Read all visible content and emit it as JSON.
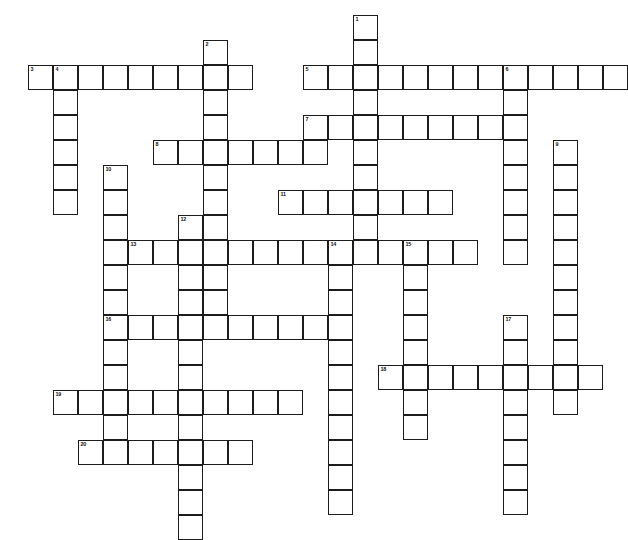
{
  "puzzle": {
    "title": "Crossword Puzzle Grid",
    "type": "blank-crossword-grid",
    "cell_size_px": 25,
    "grid_origin": {
      "x": 28,
      "y": 15
    },
    "border_color": "#1c1c1c",
    "cell_fill": "#ffffff",
    "page_background": "#ffffff",
    "numbered_clue_count": 20,
    "entries": [
      {
        "number": "1",
        "direction": "down",
        "col": 13,
        "row": 0,
        "length": 9,
        "label": "1"
      },
      {
        "number": "2",
        "direction": "down",
        "col": 7,
        "row": 1,
        "length": 12,
        "label": "2"
      },
      {
        "number": "3",
        "direction": "across",
        "col": 0,
        "row": 2,
        "length": 9,
        "label": "3"
      },
      {
        "number": "4",
        "direction": "down",
        "col": 1,
        "row": 2,
        "length": 6,
        "label": "4"
      },
      {
        "number": "5",
        "direction": "across",
        "col": 11,
        "row": 2,
        "length": 13,
        "label": "5"
      },
      {
        "number": "6",
        "direction": "down",
        "col": 19,
        "row": 2,
        "length": 8,
        "label": "6"
      },
      {
        "number": "7",
        "direction": "across",
        "col": 11,
        "row": 4,
        "length": 9,
        "label": "7"
      },
      {
        "number": "8",
        "direction": "across",
        "col": 5,
        "row": 5,
        "length": 7,
        "label": "8"
      },
      {
        "number": "9",
        "direction": "down",
        "col": 21,
        "row": 5,
        "length": 11,
        "label": "9"
      },
      {
        "number": "10",
        "direction": "down",
        "col": 3,
        "row": 6,
        "length": 12,
        "label": "10"
      },
      {
        "number": "11",
        "direction": "across",
        "col": 10,
        "row": 7,
        "length": 7,
        "label": "11"
      },
      {
        "number": "12",
        "direction": "down",
        "col": 6,
        "row": 8,
        "length": 13,
        "label": "12"
      },
      {
        "number": "13",
        "direction": "across",
        "col": 4,
        "row": 9,
        "length": 14,
        "label": "13"
      },
      {
        "number": "14",
        "direction": "down",
        "col": 12,
        "row": 9,
        "length": 11,
        "label": "14"
      },
      {
        "number": "15",
        "direction": "down",
        "col": 15,
        "row": 9,
        "length": 8,
        "label": "15"
      },
      {
        "number": "16",
        "direction": "across",
        "col": 3,
        "row": 12,
        "length": 9,
        "label": "16"
      },
      {
        "number": "17",
        "direction": "down",
        "col": 19,
        "row": 12,
        "length": 8,
        "label": "17"
      },
      {
        "number": "18",
        "direction": "across",
        "col": 14,
        "row": 14,
        "length": 9,
        "label": "18"
      },
      {
        "number": "19",
        "direction": "across",
        "col": 1,
        "row": 15,
        "length": 10,
        "label": "19"
      },
      {
        "number": "20",
        "direction": "across",
        "col": 2,
        "row": 17,
        "length": 7,
        "label": "20"
      }
    ],
    "cells": [
      {
        "x": 344,
        "y": 26,
        "n": "1"
      },
      {
        "x": 344,
        "y": 51
      },
      {
        "x": 206,
        "y": 40,
        "n": "2"
      },
      {
        "x": 28,
        "y": 65,
        "n": "3"
      },
      {
        "x": 53,
        "y": 65,
        "n": "4"
      },
      {
        "x": 78,
        "y": 65
      },
      {
        "x": 103,
        "y": 65
      },
      {
        "x": 128,
        "y": 65
      },
      {
        "x": 153,
        "y": 65
      },
      {
        "x": 178,
        "y": 65
      },
      {
        "x": 203,
        "y": 65
      },
      {
        "x": 228,
        "y": 65
      },
      {
        "x": 306,
        "y": 65,
        "n": "5"
      },
      {
        "x": 331,
        "y": 65
      },
      {
        "x": 356,
        "y": 65
      },
      {
        "x": 381,
        "y": 65
      },
      {
        "x": 406,
        "y": 65
      },
      {
        "x": 431,
        "y": 65
      },
      {
        "x": 456,
        "y": 65
      },
      {
        "x": 481,
        "y": 65,
        "n": "6"
      },
      {
        "x": 506,
        "y": 65
      },
      {
        "x": 531,
        "y": 65
      },
      {
        "x": 53,
        "y": 90
      },
      {
        "x": 53,
        "y": 115
      },
      {
        "x": 53,
        "y": 140
      },
      {
        "x": 53,
        "y": 165
      },
      {
        "x": 53,
        "y": 190
      },
      {
        "x": 206,
        "y": 90
      },
      {
        "x": 206,
        "y": 115
      },
      {
        "x": 344,
        "y": 76
      },
      {
        "x": 344,
        "y": 101
      },
      {
        "x": 306,
        "y": 101,
        "n": "7"
      },
      {
        "x": 331,
        "y": 101
      },
      {
        "x": 369,
        "y": 101
      },
      {
        "x": 394,
        "y": 101
      },
      {
        "x": 419,
        "y": 101
      },
      {
        "x": 444,
        "y": 101
      },
      {
        "x": 481,
        "y": 90
      },
      {
        "x": 481,
        "y": 115
      },
      {
        "x": 481,
        "y": 140
      },
      {
        "x": 481,
        "y": 165
      },
      {
        "x": 481,
        "y": 190
      },
      {
        "x": 481,
        "y": 215
      },
      {
        "x": 481,
        "y": 240
      },
      {
        "x": 150,
        "y": 126,
        "n": "8"
      },
      {
        "x": 175,
        "y": 126
      },
      {
        "x": 200,
        "y": 126
      },
      {
        "x": 231,
        "y": 126
      },
      {
        "x": 256,
        "y": 126
      },
      {
        "x": 527,
        "y": 127,
        "n": "9"
      },
      {
        "x": 527,
        "y": 152
      },
      {
        "x": 527,
        "y": 177
      },
      {
        "x": 527,
        "y": 202
      },
      {
        "x": 527,
        "y": 227
      },
      {
        "x": 527,
        "y": 252
      },
      {
        "x": 527,
        "y": 277
      },
      {
        "x": 527,
        "y": 302
      },
      {
        "x": 527,
        "y": 327
      },
      {
        "x": 88,
        "y": 147,
        "n": "10"
      },
      {
        "x": 88,
        "y": 172
      },
      {
        "x": 88,
        "y": 197
      },
      {
        "x": 88,
        "y": 222
      },
      {
        "x": 88,
        "y": 247
      },
      {
        "x": 88,
        "y": 295
      },
      {
        "x": 88,
        "y": 320
      },
      {
        "x": 206,
        "y": 150
      },
      {
        "x": 206,
        "y": 175
      },
      {
        "x": 285,
        "y": 164,
        "n": "11"
      },
      {
        "x": 310,
        "y": 164
      },
      {
        "x": 335,
        "y": 164
      },
      {
        "x": 360,
        "y": 164
      },
      {
        "x": 385,
        "y": 164
      },
      {
        "x": 410,
        "y": 164
      },
      {
        "x": 344,
        "y": 126
      },
      {
        "x": 344,
        "y": 151
      },
      {
        "x": 344,
        "y": 189
      },
      {
        "x": 170,
        "y": 183,
        "n": "12"
      },
      {
        "x": 170,
        "y": 232
      },
      {
        "x": 170,
        "y": 257
      },
      {
        "x": 170,
        "y": 282
      },
      {
        "x": 170,
        "y": 307
      },
      {
        "x": 170,
        "y": 332
      },
      {
        "x": 170,
        "y": 357
      },
      {
        "x": 170,
        "y": 407
      },
      {
        "x": 170,
        "y": 432
      },
      {
        "x": 128,
        "y": 207,
        "n": "13"
      },
      {
        "x": 153,
        "y": 207
      },
      {
        "x": 195,
        "y": 207
      },
      {
        "x": 220,
        "y": 207
      },
      {
        "x": 245,
        "y": 207
      },
      {
        "x": 270,
        "y": 207
      },
      {
        "x": 295,
        "y": 207
      },
      {
        "x": 320,
        "y": 207,
        "n": "14"
      },
      {
        "x": 345,
        "y": 207
      },
      {
        "x": 370,
        "y": 207
      },
      {
        "x": 390,
        "y": 207,
        "n": "15"
      },
      {
        "x": 415,
        "y": 207
      },
      {
        "x": 440,
        "y": 207
      },
      {
        "x": 320,
        "y": 232
      },
      {
        "x": 320,
        "y": 257
      },
      {
        "x": 320,
        "y": 282
      },
      {
        "x": 320,
        "y": 307
      },
      {
        "x": 320,
        "y": 332
      },
      {
        "x": 320,
        "y": 357
      },
      {
        "x": 320,
        "y": 382
      },
      {
        "x": 320,
        "y": 407
      },
      {
        "x": 390,
        "y": 232
      },
      {
        "x": 390,
        "y": 257
      },
      {
        "x": 390,
        "y": 282
      },
      {
        "x": 390,
        "y": 332
      },
      {
        "x": 390,
        "y": 357
      },
      {
        "x": 390,
        "y": 382
      },
      {
        "x": 88,
        "y": 270,
        "n": "16"
      },
      {
        "x": 113,
        "y": 270
      },
      {
        "x": 138,
        "y": 270
      },
      {
        "x": 195,
        "y": 270
      },
      {
        "x": 220,
        "y": 270
      },
      {
        "x": 245,
        "y": 270
      },
      {
        "x": 252,
        "y": 270
      },
      {
        "x": 480,
        "y": 263,
        "n": "17"
      },
      {
        "x": 480,
        "y": 288
      },
      {
        "x": 480,
        "y": 338
      },
      {
        "x": 480,
        "y": 363
      },
      {
        "x": 480,
        "y": 388
      },
      {
        "x": 363,
        "y": 307,
        "n": "18"
      },
      {
        "x": 405,
        "y": 307
      },
      {
        "x": 430,
        "y": 307
      },
      {
        "x": 455,
        "y": 307
      },
      {
        "x": 505,
        "y": 307
      },
      {
        "x": 48,
        "y": 328,
        "n": "19"
      },
      {
        "x": 73,
        "y": 328
      },
      {
        "x": 98,
        "y": 328
      },
      {
        "x": 123,
        "y": 328
      },
      {
        "x": 148,
        "y": 328
      },
      {
        "x": 195,
        "y": 328
      },
      {
        "x": 220,
        "y": 328
      },
      {
        "x": 245,
        "y": 328
      },
      {
        "x": 270,
        "y": 328
      },
      {
        "x": 71,
        "y": 386,
        "n": "20"
      },
      {
        "x": 96,
        "y": 386
      },
      {
        "x": 121,
        "y": 386
      },
      {
        "x": 146,
        "y": 386
      },
      {
        "x": 195,
        "y": 386
      },
      {
        "x": 220,
        "y": 386
      }
    ]
  }
}
